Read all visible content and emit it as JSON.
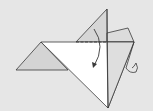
{
  "diagram": {
    "type": "origami-fold-step",
    "colors": {
      "background": "#e6e6e6",
      "paper_white": "#ffffff",
      "paper_shaded": "#d4d4d4",
      "line": "#3a3a3a"
    },
    "shapes": {
      "left_wing": "41,42 16,70 68,70",
      "upper_triangle": "107,9 76,42 107,42",
      "main_body": "41,42 134,42 108,108",
      "right_shaded": "107,42 134,42 108,108",
      "right_flap": "107,33 128,28 134,42 107,42",
      "leg": "134,42 126,68"
    },
    "arrow": {
      "path": "M94,29 Q106,46 94,66",
      "meaning": "fold-direction"
    }
  }
}
